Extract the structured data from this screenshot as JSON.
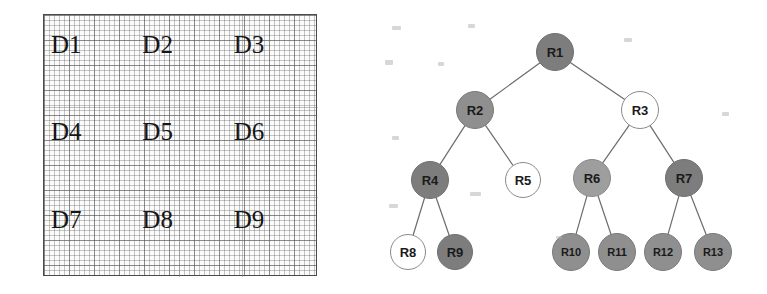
{
  "figure": {
    "background_color": "#ffffff"
  },
  "grid_panel": {
    "name": "data-region-grid",
    "border_color": "#4a4a4a",
    "cell_size_px": 5,
    "regions": [
      {
        "id": "D1",
        "label": "D1",
        "row": 1,
        "col": 1
      },
      {
        "id": "D2",
        "label": "D2",
        "row": 1,
        "col": 2
      },
      {
        "id": "D3",
        "label": "D3",
        "row": 1,
        "col": 3
      },
      {
        "id": "D4",
        "label": "D4",
        "row": 2,
        "col": 1
      },
      {
        "id": "D5",
        "label": "D5",
        "row": 2,
        "col": 2
      },
      {
        "id": "D6",
        "label": "D6",
        "row": 2,
        "col": 3
      },
      {
        "id": "D7",
        "label": "D7",
        "row": 3,
        "col": 1
      },
      {
        "id": "D8",
        "label": "D8",
        "row": 3,
        "col": 2
      },
      {
        "id": "D9",
        "label": "D9",
        "row": 3,
        "col": 3
      }
    ]
  },
  "tree_panel": {
    "name": "r-tree-diagram",
    "edge_color": "#6b6b6b",
    "fill_colors": {
      "dark_gray": "#7d7d7d",
      "medium_gray": "#8f8f8f",
      "light_gray": "#9e9e9e",
      "white": "#ffffff"
    },
    "nodes": [
      {
        "id": "R1",
        "label": "R1",
        "cx": 195,
        "cy": 52,
        "r": 19,
        "fill": "#7d7d7d",
        "stroke": "#6f6f6f",
        "level": 0
      },
      {
        "id": "R2",
        "label": "R2",
        "cx": 115,
        "cy": 110,
        "r": 19,
        "fill": "#8f8f8f",
        "stroke": "#7a7a7a",
        "level": 1
      },
      {
        "id": "R3",
        "label": "R3",
        "cx": 280,
        "cy": 110,
        "r": 19,
        "fill": "#ffffff",
        "stroke": "#8a8a8a",
        "level": 1
      },
      {
        "id": "R4",
        "label": "R4",
        "cx": 70,
        "cy": 180,
        "r": 19,
        "fill": "#7d7d7d",
        "stroke": "#6f6f6f",
        "level": 2
      },
      {
        "id": "R5",
        "label": "R5",
        "cx": 163,
        "cy": 180,
        "r": 18,
        "fill": "#ffffff",
        "stroke": "#8a8a8a",
        "level": 2
      },
      {
        "id": "R6",
        "label": "R6",
        "cx": 232,
        "cy": 178,
        "r": 19,
        "fill": "#9e9e9e",
        "stroke": "#8a8a8a",
        "level": 2
      },
      {
        "id": "R7",
        "label": "R7",
        "cx": 324,
        "cy": 178,
        "r": 19,
        "fill": "#7d7d7d",
        "stroke": "#6f6f6f",
        "level": 2
      },
      {
        "id": "R8",
        "label": "R8",
        "cx": 48,
        "cy": 252,
        "r": 18,
        "fill": "#ffffff",
        "stroke": "#8a8a8a",
        "level": 3
      },
      {
        "id": "R9",
        "label": "R9",
        "cx": 95,
        "cy": 252,
        "r": 18,
        "fill": "#7d7d7d",
        "stroke": "#6f6f6f",
        "level": 3
      },
      {
        "id": "R10",
        "label": "R10",
        "cx": 211,
        "cy": 252,
        "r": 19,
        "fill": "#8f8f8f",
        "stroke": "#7a7a7a",
        "level": 3
      },
      {
        "id": "R11",
        "label": "R11",
        "cx": 257,
        "cy": 252,
        "r": 19,
        "fill": "#8f8f8f",
        "stroke": "#7a7a7a",
        "level": 3
      },
      {
        "id": "R12",
        "label": "R12",
        "cx": 303,
        "cy": 252,
        "r": 19,
        "fill": "#8f8f8f",
        "stroke": "#7a7a7a",
        "level": 3
      },
      {
        "id": "R13",
        "label": "R13",
        "cx": 353,
        "cy": 252,
        "r": 19,
        "fill": "#8f8f8f",
        "stroke": "#7a7a7a",
        "level": 3
      }
    ],
    "edges": [
      {
        "from": "R1",
        "to": "R2"
      },
      {
        "from": "R1",
        "to": "R3"
      },
      {
        "from": "R2",
        "to": "R4"
      },
      {
        "from": "R2",
        "to": "R5"
      },
      {
        "from": "R3",
        "to": "R6"
      },
      {
        "from": "R3",
        "to": "R7"
      },
      {
        "from": "R4",
        "to": "R8"
      },
      {
        "from": "R4",
        "to": "R9"
      },
      {
        "from": "R6",
        "to": "R10"
      },
      {
        "from": "R6",
        "to": "R11"
      },
      {
        "from": "R7",
        "to": "R12"
      },
      {
        "from": "R7",
        "to": "R13"
      }
    ]
  }
}
